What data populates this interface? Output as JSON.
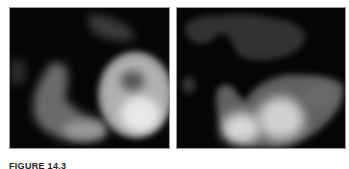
{
  "figure": {
    "panels": [
      {
        "id": "left",
        "description": "grayscale scan, ring-shaped bright structure with dark center and elongated curved structure to the left"
      },
      {
        "id": "right",
        "description": "grayscale scan, bilobed bright structure at bottom with dimmer region at top"
      }
    ],
    "caption": {
      "label": "FIGURE 14.3",
      "text": "  (caption text truncated at image edge)"
    },
    "colors": {
      "background": "#ffffff",
      "panel_background": "#000000",
      "panel_border": "#9a9a9a"
    }
  }
}
